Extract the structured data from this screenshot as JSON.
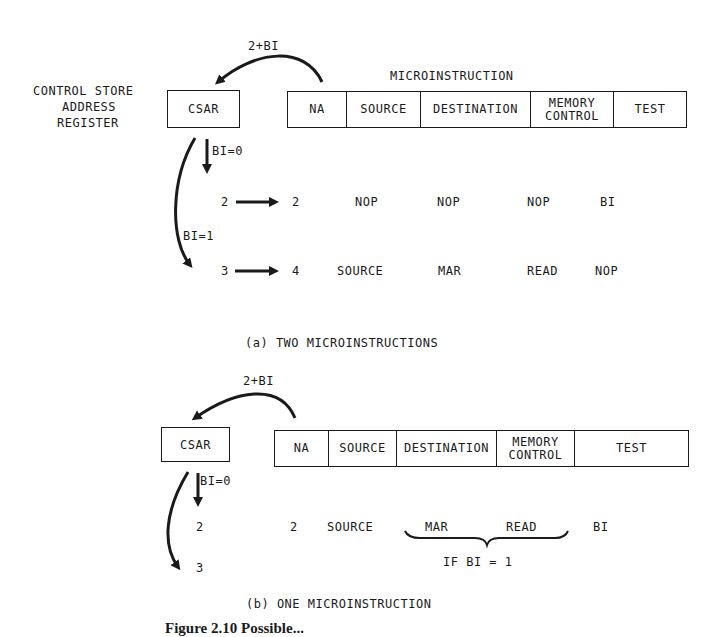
{
  "part_a": {
    "arc_label": "2+BI",
    "csar_label_lines": [
      "CONTROL STORE",
      "ADDRESS",
      "REGISTER"
    ],
    "csar_box": "CSAR",
    "micro_title": "MICROINSTRUCTION",
    "fields": [
      "NA",
      "SOURCE",
      "DESTINATION",
      "MEMORY CONTROL",
      "TEST"
    ],
    "branch0_label": "BI=0",
    "branch1_label": "BI=1",
    "rows": [
      {
        "addr": "2",
        "na": "2",
        "source": "NOP",
        "destination": "NOP",
        "memory": "NOP",
        "test": "BI"
      },
      {
        "addr": "3",
        "na": "4",
        "source": "SOURCE",
        "destination": "MAR",
        "memory": "READ",
        "test": "NOP"
      }
    ],
    "caption": "(a)  TWO MICROINSTRUCTIONS"
  },
  "part_b": {
    "arc_label": "2+BI",
    "csar_box": "CSAR",
    "fields": [
      "NA",
      "SOURCE",
      "DESTINATION",
      "MEMORY CONTROL",
      "TEST"
    ],
    "branch0_label": "BI=0",
    "addr_2": "2",
    "addr_3": "3",
    "row": {
      "na": "2",
      "source": "SOURCE",
      "destination": "MAR",
      "memory": "READ",
      "test": "BI"
    },
    "brace_label": "IF BI = 1",
    "caption": "(b)  ONE MICROINSTRUCTION"
  },
  "figure_caption": "Figure 2.10  Possible..."
}
